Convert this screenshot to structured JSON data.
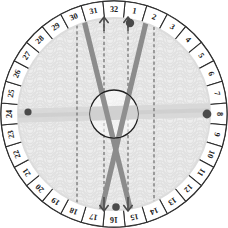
{
  "diagram": {
    "type": "radial-dial",
    "center": {
      "x": 114,
      "y": 114
    },
    "outer_radius": 113,
    "rim_inner_radius": 96,
    "hub_radius": 24,
    "cell_count": 32,
    "numbering_start_index": 32,
    "numbering_direction": "clockwise"
  },
  "colors": {
    "page_background": "#ffffff",
    "rim_fill": "#ffffff",
    "rim_stroke": "#2b2b2b",
    "face_base": "#ededed",
    "pattern_arc": "#e0e0e0",
    "pattern_arc_light": "#e7e7e7",
    "thick_line": "#8c8c8c",
    "thick_line_dark": "#7d7d7d",
    "band": "#d6d6d6",
    "dashed_line": "#6f6f6f",
    "marker_dot": "#4a4a4a",
    "hub_fill": "#ffffff",
    "hub_stroke": "#1f1f1f",
    "number_text": "#1a1a1a"
  },
  "rim": {
    "label": "numbered outer ring",
    "cells": [
      {
        "index": 1,
        "label": "1"
      },
      {
        "index": 2,
        "label": "2"
      },
      {
        "index": 3,
        "label": "3"
      },
      {
        "index": 4,
        "label": "4"
      },
      {
        "index": 5,
        "label": "5"
      },
      {
        "index": 6,
        "label": "6"
      },
      {
        "index": 7,
        "label": "7"
      },
      {
        "index": 8,
        "label": "8"
      },
      {
        "index": 9,
        "label": "9"
      },
      {
        "index": 10,
        "label": "10"
      },
      {
        "index": 11,
        "label": "11"
      },
      {
        "index": 12,
        "label": "12"
      },
      {
        "index": 13,
        "label": "13"
      },
      {
        "index": 14,
        "label": "14"
      },
      {
        "index": 15,
        "label": "15"
      },
      {
        "index": 16,
        "label": "16"
      },
      {
        "index": 17,
        "label": "17"
      },
      {
        "index": 18,
        "label": "18"
      },
      {
        "index": 19,
        "label": "19"
      },
      {
        "index": 20,
        "label": "20"
      },
      {
        "index": 21,
        "label": "21"
      },
      {
        "index": 22,
        "label": "22"
      },
      {
        "index": 23,
        "label": "23"
      },
      {
        "index": 24,
        "label": "24"
      },
      {
        "index": 25,
        "label": "25"
      },
      {
        "index": 26,
        "label": "26"
      },
      {
        "index": 27,
        "label": "27"
      },
      {
        "index": 28,
        "label": "28"
      },
      {
        "index": 29,
        "label": "29"
      },
      {
        "index": 30,
        "label": "30"
      },
      {
        "index": 31,
        "label": "31"
      },
      {
        "index": 32,
        "label": "32"
      }
    ]
  },
  "thick_lines": [
    {
      "name": "stroke-a",
      "from_cell": "31",
      "to_cell": "16",
      "x1": 82,
      "y1": 12,
      "x2": 132,
      "y2": 216
    },
    {
      "name": "stroke-b",
      "from_cell": "2",
      "to_cell": "17",
      "x1": 148,
      "y1": 14,
      "x2": 100,
      "y2": 216
    }
  ],
  "dashed_lines": [
    {
      "name": "guide-1",
      "x": 77,
      "top_cell": "30",
      "bottom_cell": "18"
    },
    {
      "name": "guide-2",
      "x": 104,
      "top_cell": "31",
      "bottom_cell": "17"
    },
    {
      "name": "guide-3",
      "x": 128,
      "top_cell": "32",
      "bottom_cell": "16"
    },
    {
      "name": "guide-4",
      "x": 154,
      "top_cell": "2",
      "bottom_cell": "15"
    }
  ],
  "band": {
    "name": "horizontal-band",
    "from_cell": "24",
    "to_cell": "8",
    "y_left": 116,
    "y_right": 110
  },
  "markers": [
    {
      "name": "marker-top",
      "cell": "32",
      "x": 130,
      "y": 23,
      "r": 4.2
    },
    {
      "name": "marker-bottom",
      "cell": "16",
      "x": 116,
      "y": 207,
      "r": 3.8
    },
    {
      "name": "marker-left",
      "cell": "24",
      "x": 28,
      "y": 112,
      "r": 3.6
    },
    {
      "name": "marker-right",
      "cell": "8",
      "x": 207,
      "y": 114,
      "r": 4.4
    }
  ],
  "arrows": [
    {
      "name": "arrow-up-left",
      "direction": "up",
      "x": 104,
      "y": 24
    },
    {
      "name": "arrow-up-right",
      "direction": "up",
      "x": 128,
      "y": 24
    },
    {
      "name": "arrow-down-left",
      "direction": "down",
      "x": 104,
      "y": 204
    },
    {
      "name": "arrow-down-right",
      "direction": "down",
      "x": 128,
      "y": 204
    }
  ]
}
